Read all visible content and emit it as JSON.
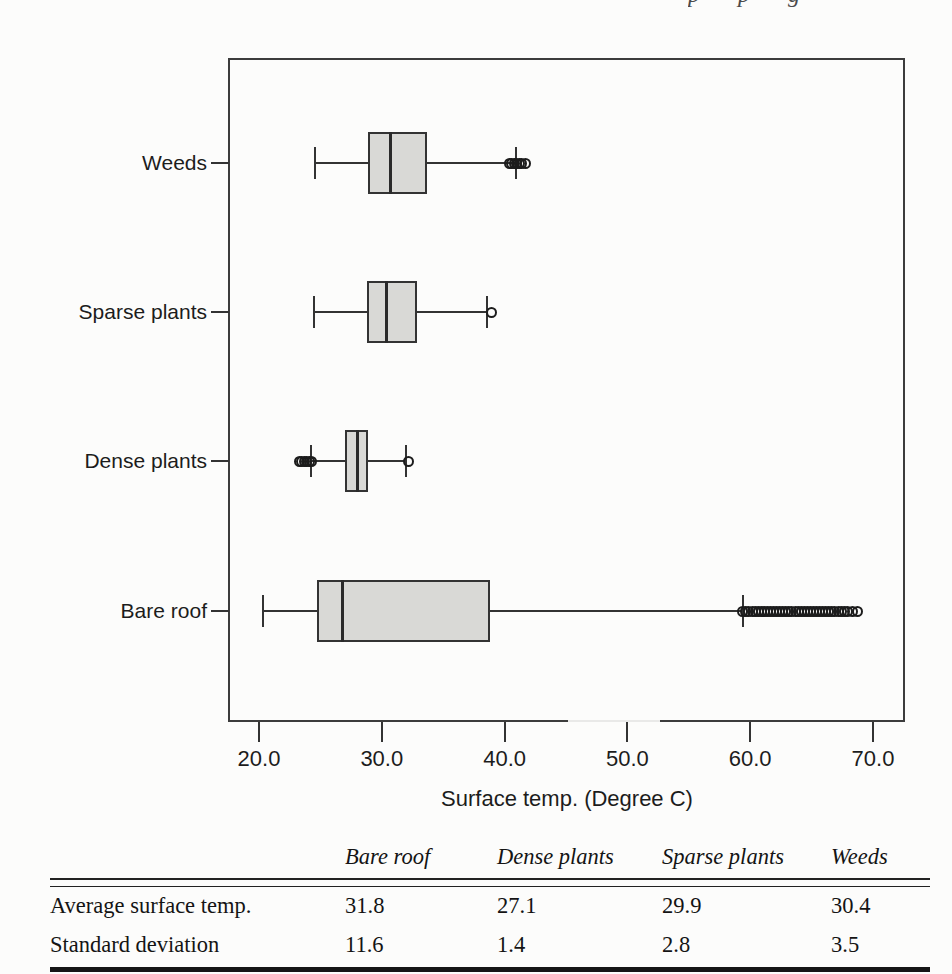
{
  "artifacts": {
    "top_fragment_text": "p p g"
  },
  "chart_data": {
    "type": "boxplot",
    "orientation": "horizontal",
    "title": "",
    "xlabel": "Surface temp. (Degree C)",
    "xlim": [
      17.5,
      72.5
    ],
    "grid": false,
    "x_ticks": [
      20,
      30,
      40,
      50,
      60,
      70
    ],
    "x_tick_labels": [
      "20.0",
      "30.0",
      "40.0",
      "50.0",
      "60.0",
      "70.0"
    ],
    "categories_top_to_bottom": [
      "Weeds",
      "Sparse plants",
      "Dense plants",
      "Bare roof"
    ],
    "series": [
      {
        "name": "Weeds",
        "whisker_low": 24.6,
        "q1": 28.9,
        "median": 30.7,
        "q3": 33.7,
        "whisker_high": 40.9,
        "outliers": [
          40.4,
          40.6,
          40.8,
          41.0,
          41.2,
          41.4,
          41.7
        ]
      },
      {
        "name": "Sparse plants",
        "whisker_low": 24.5,
        "q1": 28.8,
        "median": 30.4,
        "q3": 32.9,
        "whisker_high": 38.6,
        "outliers": [
          38.9
        ]
      },
      {
        "name": "Dense plants",
        "whisker_low": 24.2,
        "q1": 27.0,
        "median": 28.0,
        "q3": 28.9,
        "whisker_high": 32.0,
        "outliers": [
          23.3,
          23.5,
          23.7,
          23.9,
          24.1,
          24.3,
          32.2
        ]
      },
      {
        "name": "Bare roof",
        "whisker_low": 20.3,
        "q1": 24.7,
        "median": 26.8,
        "q3": 38.8,
        "whisker_high": 59.4,
        "outliers": [
          59.4,
          59.65,
          59.9,
          60.15,
          60.4,
          60.65,
          60.9,
          61.15,
          61.4,
          61.65,
          61.9,
          62.15,
          62.4,
          62.65,
          62.9,
          63.15,
          63.4,
          63.65,
          63.9,
          64.15,
          64.4,
          64.65,
          64.9,
          65.15,
          65.4,
          65.65,
          65.9,
          66.15,
          66.4,
          66.65,
          66.9,
          67.15,
          67.4,
          67.65,
          67.9,
          68.35,
          68.7
        ]
      }
    ],
    "box_fill_color": "#d9d9d6",
    "line_color": "#333333"
  },
  "summary_table": {
    "headers": [
      "Bare roof",
      "Dense plants",
      "Sparse plants",
      "Weeds"
    ],
    "rows": [
      {
        "label": "Average surface temp.",
        "values": [
          "31.8",
          "27.1",
          "29.9",
          "30.4"
        ]
      },
      {
        "label": "Standard deviation",
        "values": [
          "11.6",
          "1.4",
          "2.8",
          "3.5"
        ]
      }
    ]
  }
}
